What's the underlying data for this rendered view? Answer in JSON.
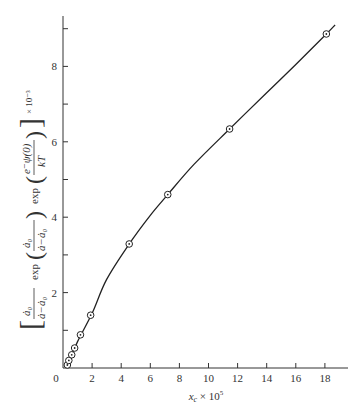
{
  "chart_data": {
    "type": "line",
    "title": "",
    "xlabel": "x_c × 10^5",
    "xlabel_main": "x",
    "xlabel_sub": "c",
    "xlabel_rest": " × 10",
    "xlabel_exp": "5",
    "ylabel": "[ ȧ0/(ȧ−ȧ0) exp( ȧ0/(ȧ−ȧ0) ) exp( e⁻ψ(0)/kT ) ] × 10^-3",
    "ylabel_parts": {
      "frac1_num": "ȧ₀",
      "frac1_den": "ȧ−ȧ₀",
      "exp1": "exp",
      "frac2_num": "ȧ₀",
      "frac2_den": "ȧ−ȧ₀",
      "exp2": "exp",
      "frac3_num": "e⁻ψ(0)",
      "frac3_den": "kT",
      "scale": "× 10⁻³"
    },
    "xlim": [
      0,
      19
    ],
    "ylim": [
      0,
      9.3
    ],
    "xticks": [
      0,
      2,
      4,
      6,
      8,
      10,
      12,
      14,
      16,
      18
    ],
    "xtick_labels": [
      "0",
      "2",
      "4",
      "6",
      "8",
      "10",
      "12",
      "14",
      "16",
      "18"
    ],
    "yticks_major": [
      2,
      4,
      6,
      8
    ],
    "ytick_labels": [
      "2",
      "4",
      "6",
      "8"
    ],
    "yticks_minor": [
      1,
      3,
      5,
      7,
      9
    ],
    "grid": false,
    "legend": null,
    "series": [
      {
        "name": "measured",
        "marker": "circle-dot",
        "x": [
          0.3,
          0.4,
          0.6,
          0.8,
          1.2,
          1.9,
          4.55,
          7.2,
          11.45,
          18.1
        ],
        "y": [
          0.08,
          0.2,
          0.35,
          0.53,
          0.88,
          1.4,
          3.29,
          4.6,
          6.34,
          8.86
        ]
      }
    ],
    "fit_curve": {
      "x": [
        0.2,
        0.5,
        1.0,
        2.0,
        3.0,
        4.55,
        6.0,
        7.2,
        9.0,
        11.45,
        14.0,
        16.0,
        18.1,
        18.7
      ],
      "y": [
        0.02,
        0.25,
        0.7,
        1.45,
        2.35,
        3.29,
        4.05,
        4.6,
        5.4,
        6.34,
        7.3,
        8.05,
        8.86,
        9.1
      ]
    }
  },
  "axes": {
    "x_origin_label": "0"
  }
}
